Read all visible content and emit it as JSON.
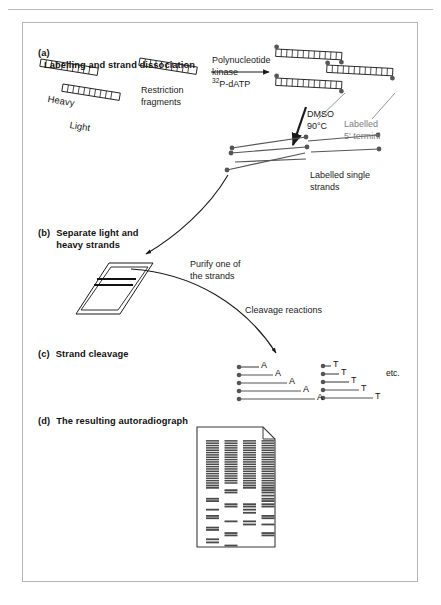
{
  "figure": {
    "title_implicit": "Maxam-Gilbert DNA sequencing workflow",
    "sections": [
      {
        "tag": "(a)",
        "label": "Labelling and strand dissociation"
      },
      {
        "tag": "(b)",
        "label": "Separate light and\nheavy strands"
      },
      {
        "tag": "(c)",
        "label": "Strand cleavage"
      },
      {
        "tag": "(d)",
        "label": "The resulting autoradiograph"
      }
    ]
  },
  "panel_a": {
    "strand_labels": {
      "heavy": "Heavy",
      "light": "Light"
    },
    "fragments_label": "Restriction\nfragments",
    "reaction_top": "Polynucleotide\nkinase",
    "reaction_bottom_prefix": "32",
    "reaction_bottom_rest": "P-dATP",
    "dmso_label": "DMSO\n90°C",
    "termini_label": "Labelled\n5′ termini",
    "single_strands_label": "Labelled single\nstrands"
  },
  "panel_b": {
    "purify_label": "Purify one of\nthe strands",
    "cleavage_label": "Cleavage reactions"
  },
  "panel_c": {
    "etc_label": "etc.",
    "group_a": {
      "base": "A",
      "ladders": [
        {
          "length": 20,
          "letter_dx": 3
        },
        {
          "length": 34,
          "letter_dx": 3
        },
        {
          "length": 48,
          "letter_dx": 3
        },
        {
          "length": 62,
          "letter_dx": 3
        },
        {
          "length": 76,
          "letter_dx": 3
        }
      ]
    },
    "group_t": {
      "base": "T",
      "ladders": [
        {
          "length": 8,
          "letter_dx": 3
        },
        {
          "length": 16,
          "letter_dx": 3
        },
        {
          "length": 26,
          "letter_dx": 3
        },
        {
          "length": 36,
          "letter_dx": 3
        },
        {
          "length": 50,
          "letter_dx": 3
        }
      ]
    }
  },
  "panel_d": {
    "lanes": 4,
    "gel": {
      "x": 174,
      "y": 20,
      "width": 78,
      "height": 120,
      "corner_cut": 12
    },
    "band_rows": [
      {
        "y": 4,
        "lanes": [
          1,
          1,
          1,
          1
        ]
      },
      {
        "y": 7,
        "lanes": [
          1,
          1,
          1,
          1
        ]
      },
      {
        "y": 10,
        "lanes": [
          1,
          1,
          1,
          1
        ]
      },
      {
        "y": 13,
        "lanes": [
          1,
          1,
          1,
          1
        ]
      },
      {
        "y": 16,
        "lanes": [
          1,
          1,
          1,
          1
        ]
      },
      {
        "y": 19,
        "lanes": [
          1,
          1,
          1,
          1
        ]
      },
      {
        "y": 22,
        "lanes": [
          1,
          1,
          1,
          1
        ]
      },
      {
        "y": 25,
        "lanes": [
          1,
          1,
          1,
          1
        ]
      },
      {
        "y": 28,
        "lanes": [
          1,
          1,
          1,
          1
        ]
      },
      {
        "y": 31,
        "lanes": [
          1,
          1,
          1,
          1
        ]
      },
      {
        "y": 34,
        "lanes": [
          1,
          1,
          1,
          1
        ]
      },
      {
        "y": 37,
        "lanes": [
          1,
          1,
          1,
          1
        ]
      },
      {
        "y": 40,
        "lanes": [
          1,
          1,
          1,
          1
        ]
      },
      {
        "y": 43,
        "lanes": [
          1,
          1,
          1,
          1
        ]
      },
      {
        "y": 46,
        "lanes": [
          1,
          1,
          1,
          1
        ]
      },
      {
        "y": 49,
        "lanes": [
          1,
          1,
          1,
          1
        ]
      },
      {
        "y": 52,
        "lanes": [
          1,
          1,
          1,
          1
        ]
      },
      {
        "y": 55,
        "lanes": [
          1,
          1,
          1,
          1
        ]
      },
      {
        "y": 58,
        "lanes": [
          1,
          1,
          1,
          1
        ]
      },
      {
        "y": 61,
        "lanes": [
          1,
          0,
          1,
          1
        ]
      },
      {
        "y": 64,
        "lanes": [
          1,
          0,
          1,
          1
        ]
      },
      {
        "y": 67,
        "lanes": [
          0,
          1,
          0,
          1
        ]
      },
      {
        "y": 70,
        "lanes": [
          0,
          1,
          0,
          1
        ]
      },
      {
        "y": 74,
        "lanes": [
          0,
          0,
          0,
          1
        ]
      },
      {
        "y": 78,
        "lanes": [
          1,
          0,
          0,
          1
        ]
      },
      {
        "y": 81,
        "lanes": [
          1,
          0,
          0,
          1
        ]
      },
      {
        "y": 85,
        "lanes": [
          0,
          1,
          1,
          1
        ]
      },
      {
        "y": 88,
        "lanes": [
          0,
          1,
          1,
          1
        ]
      },
      {
        "y": 92,
        "lanes": [
          1,
          0,
          1,
          0
        ]
      },
      {
        "y": 96,
        "lanes": [
          0,
          0,
          1,
          0
        ]
      },
      {
        "y": 100,
        "lanes": [
          1,
          0,
          0,
          1
        ]
      },
      {
        "y": 103,
        "lanes": [
          1,
          0,
          0,
          1
        ]
      },
      {
        "y": 107,
        "lanes": [
          0,
          1,
          1,
          0
        ]
      },
      {
        "y": 111,
        "lanes": [
          0,
          0,
          1,
          1
        ]
      },
      {
        "y": 115,
        "lanes": [
          1,
          0,
          0,
          0
        ]
      },
      {
        "y": 118,
        "lanes": [
          1,
          0,
          0,
          0
        ]
      },
      {
        "y": 122,
        "lanes": [
          0,
          1,
          0,
          1
        ]
      },
      {
        "y": 125,
        "lanes": [
          0,
          1,
          0,
          1
        ]
      },
      {
        "y": 130,
        "lanes": [
          1,
          0,
          0,
          0
        ]
      },
      {
        "y": 134,
        "lanes": [
          1,
          0,
          0,
          0
        ]
      },
      {
        "y": 138,
        "lanes": [
          0,
          1,
          0,
          0
        ]
      }
    ]
  },
  "colors": {
    "ink": "#1a1a1a",
    "gray_text": "#7e7e7e",
    "frame": "#b5b5b5",
    "band": "#4a4a4a",
    "dot": "#555555"
  }
}
